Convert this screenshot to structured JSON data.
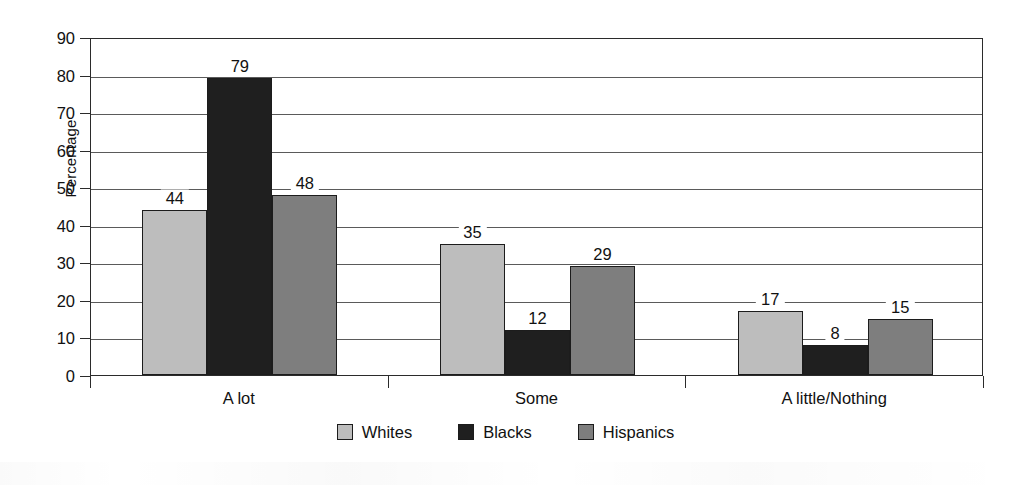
{
  "chart_data": {
    "type": "bar",
    "title": "",
    "subtitle": "",
    "xlabel": "",
    "ylabel": "Percentage",
    "categories": [
      "A lot",
      "Some",
      "A little/Nothing"
    ],
    "series": [
      {
        "name": "Whites",
        "values": [
          44,
          35,
          17
        ],
        "color": "#bdbdbd"
      },
      {
        "name": "Blacks",
        "values": [
          79,
          12,
          8
        ],
        "color": "#1f1f1f"
      },
      {
        "name": "Hispanics",
        "values": [
          48,
          29,
          15
        ],
        "color": "#7e7e7e"
      }
    ],
    "ylim": [
      0,
      90
    ],
    "ytick_step": 10,
    "yticks": [
      0,
      10,
      20,
      30,
      40,
      50,
      60,
      70,
      80,
      90
    ],
    "ytick_labels": [
      "0",
      "10",
      "20",
      "30",
      "40",
      "50",
      "60",
      "70",
      "80",
      "90"
    ],
    "grid": true,
    "grid_axis": "y",
    "legend_position": "bottom",
    "data_labels": true,
    "plot_border": true,
    "axis_color": "#2b2b2b",
    "grid_color": "#5a5a5a",
    "background": "#ffffff"
  }
}
